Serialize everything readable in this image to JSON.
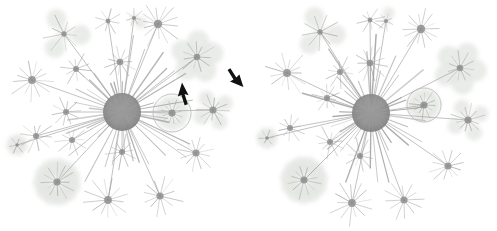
{
  "figure": {
    "background_color": "#ffffff",
    "width": 497,
    "height": 231,
    "panel_count": 2,
    "annotation_color": "#1a1a1a",
    "node_color": "#8c8c8c",
    "edge_color": "#9a9a9a",
    "halo_color": "#dfe2dd",
    "highlight_circle_color": "#b4b4b4"
  },
  "panels": [
    {
      "id": "panel-left",
      "label": "left-graph",
      "annotated": true,
      "hub": {
        "cx": 122,
        "cy": 112,
        "r": 19
      },
      "highlight_circle": {
        "cx": 172,
        "cy": 113,
        "r": 19
      },
      "arrows": [
        {
          "name": "up-arrow-annotation",
          "direction": "up",
          "tip_x": 182,
          "tip_y": 83,
          "tail_x": 186,
          "tail_y": 103,
          "color": "#111111"
        },
        {
          "name": "down-arrow-annotation",
          "direction": "down-right",
          "tip_x": 243,
          "tip_y": 86,
          "tail_x": 231,
          "tail_y": 62,
          "color": "#111111"
        }
      ]
    },
    {
      "id": "panel-right",
      "label": "right-graph",
      "annotated": false,
      "hub": {
        "cx": 119,
        "cy": 113,
        "r": 19
      },
      "highlight_circle": {
        "cx": 172,
        "cy": 105,
        "r": 17
      },
      "arrows": []
    }
  ],
  "chart_data": {
    "type": "scatter",
    "title": "Hub-and-spoke network graph comparison",
    "subtitle": "",
    "xlabel": "",
    "ylabel": "",
    "grid": false,
    "legend": "none",
    "series": [
      {
        "name": "left-graph",
        "hub": {
          "x": 122,
          "y": 112,
          "degree": 34,
          "radius": 19
        },
        "satellites": [
          {
            "x": 64,
            "y": 34,
            "spokes": 9,
            "reach": 19,
            "petals": 3,
            "petal_r": 10
          },
          {
            "x": 108,
            "y": 21,
            "spokes": 8,
            "reach": 13,
            "petals": 0,
            "petal_r": 0
          },
          {
            "x": 134,
            "y": 18,
            "spokes": 7,
            "reach": 9,
            "petals": 1,
            "petal_r": 6
          },
          {
            "x": 158,
            "y": 24,
            "spokes": 14,
            "reach": 22,
            "petals": 0,
            "petal_r": 0
          },
          {
            "x": 197,
            "y": 57,
            "spokes": 11,
            "reach": 17,
            "petals": 5,
            "petal_r": 11
          },
          {
            "x": 32,
            "y": 80,
            "spokes": 13,
            "reach": 21,
            "petals": 0,
            "petal_r": 0
          },
          {
            "x": 76,
            "y": 69,
            "spokes": 10,
            "reach": 15,
            "petals": 0,
            "petal_r": 0
          },
          {
            "x": 120,
            "y": 62,
            "spokes": 11,
            "reach": 17,
            "petals": 0,
            "petal_r": 0
          },
          {
            "x": 66,
            "y": 112,
            "spokes": 10,
            "reach": 14,
            "petals": 0,
            "petal_r": 0
          },
          {
            "x": 172,
            "y": 113,
            "spokes": 12,
            "reach": 14,
            "petals": 9,
            "petal_r": 6
          },
          {
            "x": 213,
            "y": 110,
            "spokes": 12,
            "reach": 15,
            "petals": 4,
            "petal_r": 8
          },
          {
            "x": 17,
            "y": 145,
            "spokes": 6,
            "reach": 8,
            "petals": 7,
            "petal_r": 4
          },
          {
            "x": 36,
            "y": 136,
            "spokes": 10,
            "reach": 16,
            "petals": 0,
            "petal_r": 0
          },
          {
            "x": 72,
            "y": 140,
            "spokes": 10,
            "reach": 15,
            "petals": 0,
            "petal_r": 0
          },
          {
            "x": 122,
            "y": 152,
            "spokes": 10,
            "reach": 16,
            "petals": 0,
            "petal_r": 0
          },
          {
            "x": 196,
            "y": 153,
            "spokes": 12,
            "reach": 18,
            "petals": 0,
            "petal_r": 0
          },
          {
            "x": 57,
            "y": 182,
            "spokes": 12,
            "reach": 17,
            "petals": 11,
            "petal_r": 9
          },
          {
            "x": 108,
            "y": 200,
            "spokes": 13,
            "reach": 22,
            "petals": 0,
            "petal_r": 0
          },
          {
            "x": 160,
            "y": 196,
            "spokes": 12,
            "reach": 21,
            "petals": 0,
            "petal_r": 0
          }
        ]
      },
      {
        "name": "right-graph",
        "hub": {
          "x": 119,
          "y": 113,
          "degree": 32,
          "radius": 19
        },
        "satellites": [
          {
            "x": 68,
            "y": 32,
            "spokes": 9,
            "reach": 18,
            "petals": 3,
            "petal_r": 10
          },
          {
            "x": 118,
            "y": 20,
            "spokes": 8,
            "reach": 13,
            "petals": 0,
            "petal_r": 0
          },
          {
            "x": 134,
            "y": 21,
            "spokes": 7,
            "reach": 9,
            "petals": 1,
            "petal_r": 6
          },
          {
            "x": 169,
            "y": 29,
            "spokes": 14,
            "reach": 22,
            "petals": 0,
            "petal_r": 0
          },
          {
            "x": 208,
            "y": 68,
            "spokes": 11,
            "reach": 17,
            "petals": 5,
            "petal_r": 11
          },
          {
            "x": 35,
            "y": 73,
            "spokes": 13,
            "reach": 21,
            "petals": 0,
            "petal_r": 0
          },
          {
            "x": 88,
            "y": 72,
            "spokes": 10,
            "reach": 15,
            "petals": 0,
            "petal_r": 0
          },
          {
            "x": 118,
            "y": 63,
            "spokes": 11,
            "reach": 17,
            "petals": 0,
            "petal_r": 0
          },
          {
            "x": 75,
            "y": 98,
            "spokes": 10,
            "reach": 14,
            "petals": 0,
            "petal_r": 0
          },
          {
            "x": 172,
            "y": 105,
            "spokes": 12,
            "reach": 13,
            "petals": 9,
            "petal_r": 6
          },
          {
            "x": 216,
            "y": 120,
            "spokes": 12,
            "reach": 16,
            "petals": 4,
            "petal_r": 8
          },
          {
            "x": 15,
            "y": 138,
            "spokes": 6,
            "reach": 8,
            "petals": 7,
            "petal_r": 4
          },
          {
            "x": 38,
            "y": 128,
            "spokes": 10,
            "reach": 16,
            "petals": 0,
            "petal_r": 0
          },
          {
            "x": 78,
            "y": 142,
            "spokes": 10,
            "reach": 15,
            "petals": 0,
            "petal_r": 0
          },
          {
            "x": 108,
            "y": 156,
            "spokes": 10,
            "reach": 16,
            "petals": 0,
            "petal_r": 0
          },
          {
            "x": 196,
            "y": 166,
            "spokes": 12,
            "reach": 18,
            "petals": 0,
            "petal_r": 0
          },
          {
            "x": 52,
            "y": 180,
            "spokes": 12,
            "reach": 17,
            "petals": 11,
            "petal_r": 9
          },
          {
            "x": 100,
            "y": 203,
            "spokes": 13,
            "reach": 22,
            "petals": 0,
            "petal_r": 0
          },
          {
            "x": 152,
            "y": 200,
            "spokes": 12,
            "reach": 21,
            "petals": 0,
            "petal_r": 0
          }
        ]
      }
    ]
  }
}
